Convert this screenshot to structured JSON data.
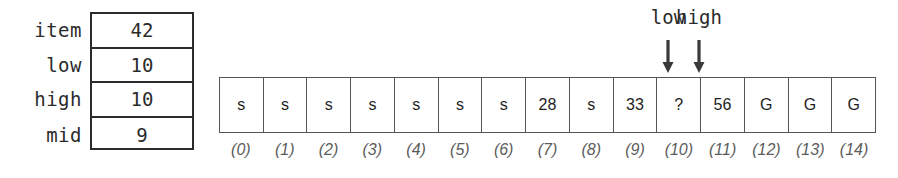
{
  "diagram": {
    "colors": {
      "ink": "#2b2b2b",
      "cell_border": "#555555",
      "index_label": "#5c5c5c",
      "background": "#ffffff"
    }
  },
  "variables": {
    "rows": [
      {
        "name": "item",
        "value": "42"
      },
      {
        "name": "low",
        "value": "10"
      },
      {
        "name": "high",
        "value": "10"
      },
      {
        "name": "mid",
        "value": "9"
      }
    ]
  },
  "array": {
    "cells": [
      {
        "index": "(0)",
        "value": "s"
      },
      {
        "index": "(1)",
        "value": "s"
      },
      {
        "index": "(2)",
        "value": "s"
      },
      {
        "index": "(3)",
        "value": "s"
      },
      {
        "index": "(4)",
        "value": "s"
      },
      {
        "index": "(5)",
        "value": "s"
      },
      {
        "index": "(6)",
        "value": "s"
      },
      {
        "index": "(7)",
        "value": "28"
      },
      {
        "index": "(8)",
        "value": "s"
      },
      {
        "index": "(9)",
        "value": "33"
      },
      {
        "index": "(10)",
        "value": "?"
      },
      {
        "index": "(11)",
        "value": "56"
      },
      {
        "index": "(12)",
        "value": "G"
      },
      {
        "index": "(13)",
        "value": "G"
      },
      {
        "index": "(14)",
        "value": "G"
      }
    ]
  },
  "pointers": [
    {
      "label": "low",
      "target_index": "(10)",
      "x": 668
    },
    {
      "label": "high",
      "target_index": "(10)",
      "x": 699
    }
  ]
}
